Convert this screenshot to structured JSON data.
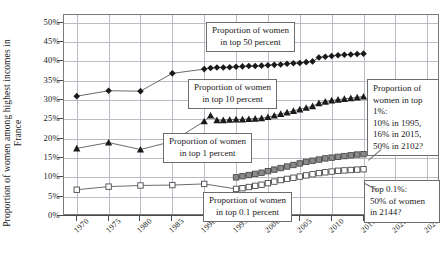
{
  "chart_data": {
    "type": "line",
    "title": "",
    "xlabel": "",
    "ylabel": "Proportion of women among highest incomes in France",
    "xlim": [
      1968,
      2027
    ],
    "ylim": [
      0,
      52
    ],
    "grid": true,
    "legend_position": "inline-annotations",
    "x_ticks": [
      "1970",
      "1975",
      "1980",
      "1985",
      "1990",
      "1995",
      "2000",
      "2005",
      "2010",
      "2015",
      "2020",
      "2025"
    ],
    "y_ticks": [
      "0%",
      "5%",
      "10%",
      "15%",
      "20%",
      "25%",
      "30%",
      "35%",
      "40%",
      "45%",
      "50%"
    ],
    "series": [
      {
        "name": "Proportion of women in top 50 percent",
        "marker": "filled-diamond",
        "color": "#1a1a1a",
        "x": [
          1970,
          1975,
          1980,
          1985,
          1990,
          1991,
          1992,
          1993,
          1994,
          1995,
          1996,
          1997,
          1998,
          1999,
          2000,
          2001,
          2002,
          2003,
          2004,
          2005,
          2006,
          2007,
          2008,
          2009,
          2010,
          2011,
          2012,
          2013,
          2014,
          2015
        ],
        "values": [
          31.0,
          32.4,
          32.3,
          36.9,
          38.0,
          38.3,
          38.4,
          38.4,
          38.5,
          38.6,
          38.7,
          38.8,
          38.8,
          38.9,
          39.0,
          39.1,
          39.2,
          39.4,
          39.5,
          39.6,
          39.8,
          40.0,
          41.0,
          41.2,
          41.4,
          41.6,
          41.7,
          41.8,
          41.9,
          42.0
        ]
      },
      {
        "name": "Proportion of women in top 10 percent",
        "marker": "filled-triangle",
        "color": "#1a1a1a",
        "x": [
          1970,
          1975,
          1980,
          1985,
          1990,
          1991,
          1992,
          1993,
          1994,
          1995,
          1996,
          1997,
          1998,
          1999,
          2000,
          2001,
          2002,
          2003,
          2004,
          2005,
          2006,
          2007,
          2008,
          2009,
          2010,
          2011,
          2012,
          2013,
          2014,
          2015
        ],
        "values": [
          17.5,
          19.0,
          17.2,
          19.3,
          24.5,
          26.0,
          24.8,
          24.8,
          24.9,
          25.0,
          25.0,
          25.1,
          25.2,
          25.3,
          25.6,
          26.0,
          26.4,
          26.8,
          27.2,
          27.6,
          28.0,
          28.4,
          29.2,
          29.6,
          29.9,
          30.1,
          30.3,
          30.5,
          30.7,
          30.9
        ]
      },
      {
        "name": "Proportion of women in top 1 percent",
        "marker": "gray-square",
        "color": "#8a8a8a",
        "x": [
          1995,
          1996,
          1997,
          1998,
          1999,
          2000,
          2001,
          2002,
          2003,
          2004,
          2005,
          2006,
          2007,
          2008,
          2009,
          2010,
          2011,
          2012,
          2013,
          2014,
          2015
        ],
        "values": [
          10.0,
          10.3,
          10.6,
          10.9,
          11.2,
          11.6,
          12.0,
          12.4,
          12.8,
          13.2,
          13.6,
          14.0,
          14.3,
          14.6,
          14.9,
          15.1,
          15.3,
          15.5,
          15.7,
          15.9,
          16.0
        ]
      },
      {
        "name": "Proportion of women in top 0.1 percent",
        "marker": "white-square",
        "color": "#ffffff",
        "x": [
          1970,
          1975,
          1980,
          1985,
          1990,
          1995,
          1996,
          1997,
          1998,
          1999,
          2000,
          2001,
          2002,
          2003,
          2004,
          2005,
          2006,
          2007,
          2008,
          2009,
          2010,
          2011,
          2012,
          2013,
          2014,
          2015
        ],
        "values": [
          6.8,
          7.6,
          7.9,
          8.0,
          8.3,
          7.0,
          7.2,
          7.5,
          7.8,
          8.1,
          8.5,
          8.9,
          9.3,
          9.6,
          9.9,
          10.2,
          10.5,
          10.8,
          11.1,
          11.3,
          11.5,
          11.7,
          11.8,
          11.9,
          12.0,
          12.1
        ]
      }
    ]
  },
  "annotations": {
    "top50": {
      "line1": "Proportion of women",
      "line2": "in top 50 percent"
    },
    "top10": {
      "line1": "Proportion of women",
      "line2": "in top 10 percent"
    },
    "top1": {
      "line1": "Proportion of women",
      "line2": "in top 1 percent"
    },
    "top01": {
      "line1": "Proportion of women",
      "line2": "in top 0.1 percent"
    },
    "callout_top1": {
      "line1": "Proportion of",
      "line2": "women in top",
      "line3": "1%:",
      "line4": "10% in 1995,",
      "line5": "16% in 2015,",
      "line6": "50% in 2102?"
    },
    "callout_top01": {
      "line1": "Top 0.1%:",
      "line2": "50% of women",
      "line3": "in 2144?"
    }
  }
}
